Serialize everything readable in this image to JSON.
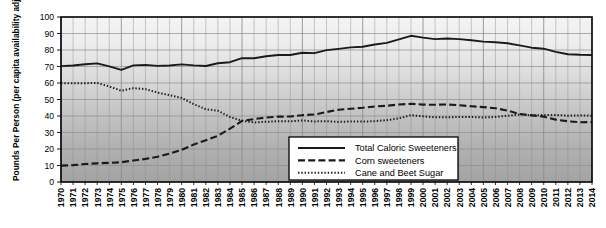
{
  "chart_data": {
    "type": "line",
    "title": "",
    "xlabel": "",
    "ylabel": "Pounds Per Person (per capita availability adjusted for loss)",
    "ylim": [
      0,
      100
    ],
    "ytick_step": 10,
    "yticks": [
      0,
      10,
      20,
      30,
      40,
      50,
      60,
      70,
      80,
      90,
      100
    ],
    "grid": true,
    "legend_position": "inside-bottom-center",
    "x": [
      1970,
      1971,
      1972,
      1973,
      1974,
      1975,
      1976,
      1977,
      1978,
      1979,
      1980,
      1981,
      1982,
      1983,
      1984,
      1985,
      1986,
      1987,
      1988,
      1989,
      1990,
      1991,
      1992,
      1993,
      1994,
      1995,
      1996,
      1997,
      1998,
      1999,
      2000,
      2001,
      2002,
      2003,
      2004,
      2005,
      2006,
      2007,
      2008,
      2009,
      2010,
      2011,
      2012,
      2013,
      2014
    ],
    "categories": [
      "1970",
      "1971",
      "1972",
      "1973",
      "1974",
      "1975",
      "1976",
      "1977",
      "1978",
      "1979",
      "1980",
      "1981",
      "1982",
      "1983",
      "1984",
      "1985",
      "1986",
      "1987",
      "1988",
      "1989",
      "1990",
      "1991",
      "1992",
      "1993",
      "1994",
      "1995",
      "1996",
      "1997",
      "1998",
      "1999",
      "2000",
      "2001",
      "2002",
      "2003",
      "2004",
      "2005",
      "2006",
      "2007",
      "2008",
      "2009",
      "2010",
      "2011",
      "2012",
      "2013",
      "2014"
    ],
    "series": [
      {
        "name": "Total Caloric Sweeteners",
        "style": "solid",
        "color": "#1a1a1a",
        "values": [
          70.2,
          70.6,
          71.4,
          71.9,
          70.1,
          68.0,
          70.7,
          71.0,
          70.4,
          70.6,
          71.3,
          70.7,
          70.3,
          72.0,
          72.6,
          75.1,
          75.0,
          76.2,
          77.0,
          77.0,
          78.3,
          78.1,
          79.9,
          80.7,
          81.6,
          82.0,
          83.3,
          84.3,
          86.4,
          88.6,
          87.5,
          86.6,
          87.0,
          86.6,
          85.9,
          85.1,
          84.7,
          84.1,
          82.8,
          81.4,
          80.8,
          78.9,
          77.4,
          77.1,
          77.0
        ]
      },
      {
        "name": "Corn sweeteners",
        "style": "dashed",
        "color": "#1a1a1a",
        "values": [
          9.9,
          10.2,
          10.9,
          11.3,
          11.6,
          12.0,
          13.0,
          14.0,
          15.3,
          17.2,
          19.5,
          22.7,
          25.3,
          28.0,
          32.3,
          37.1,
          38.1,
          39.1,
          39.6,
          39.7,
          40.5,
          40.9,
          42.4,
          43.8,
          44.4,
          45.0,
          45.8,
          46.2,
          47.0,
          47.4,
          46.9,
          46.8,
          47.0,
          46.5,
          45.9,
          45.4,
          44.7,
          43.3,
          41.2,
          40.4,
          39.6,
          37.8,
          36.8,
          36.2,
          36.3
        ]
      },
      {
        "name": "Cane and Beet Sugar",
        "style": "dotted",
        "color": "#1a1a1a",
        "values": [
          59.9,
          59.8,
          59.9,
          60.0,
          57.9,
          55.3,
          56.9,
          56.3,
          54.2,
          52.6,
          50.9,
          47.2,
          44.1,
          43.2,
          39.4,
          37.1,
          36.1,
          36.5,
          36.8,
          36.8,
          37.3,
          36.7,
          36.9,
          36.4,
          36.7,
          36.6,
          36.9,
          37.5,
          38.6,
          40.5,
          39.8,
          39.2,
          39.2,
          39.4,
          39.4,
          39.1,
          39.4,
          40.2,
          40.9,
          40.4,
          40.6,
          40.6,
          40.2,
          40.4,
          40.2
        ]
      }
    ]
  },
  "legend": {
    "items": [
      {
        "label": "Total Caloric Sweeteners",
        "style": "solid"
      },
      {
        "label": "Corn sweeteners",
        "style": "dashed"
      },
      {
        "label": "Cane and Beet Sugar",
        "style": "dotted"
      }
    ]
  },
  "axes": {
    "y_title": "Pounds Per Person (per capita availability adjusted for loss)"
  },
  "colors": {
    "line": "#1a1a1a",
    "grid": "#8c8c8c",
    "axis": "#000000",
    "plot_bg_top": "#f2f2f2",
    "plot_bg_bottom": "#a6a6a6"
  }
}
